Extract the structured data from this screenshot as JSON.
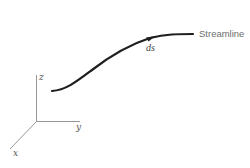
{
  "diagram": {
    "axes": {
      "x_label": "x",
      "y_label": "y",
      "z_label": "z"
    },
    "streamline": {
      "label": "Streamline",
      "element_label": "ds"
    },
    "colors": {
      "curve": "#1e1e1e",
      "axes": "#8a8a8a",
      "label_text": "#6e6e6e",
      "background": "#ffffff"
    }
  }
}
